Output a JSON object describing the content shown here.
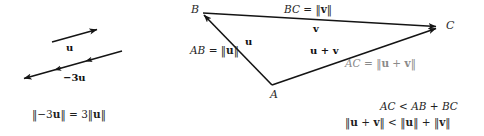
{
  "figure": {
    "background_color": "#ffffff",
    "ink_color": "#1a1a1a",
    "muted_color": "#8a8a8a"
  },
  "left_panel": {
    "name": "scalar-multiple-diagram",
    "vectors": [
      {
        "key": "u",
        "label": "u",
        "description": "short vector u pointing up and to the right",
        "x1": 52,
        "y1": 42,
        "x2": 99,
        "y2": 29,
        "tick_count": 0
      },
      {
        "key": "minus3u",
        "label": "−3u",
        "description": "vector of three times the length of u pointing down and to the left",
        "x1": 122,
        "y1": 51,
        "x2": 22,
        "y2": 79,
        "tick_count": 3
      }
    ],
    "caption": "‖−3u‖ = 3‖u‖",
    "caption_parts": {
      "lhs_open": "‖",
      "lhs_scalar": "−3",
      "lhs_vector": "u",
      "lhs_close": "‖",
      "equals": "=",
      "rhs_scalar": "3",
      "rhs_open": "‖",
      "rhs_vector": "u",
      "rhs_close": "‖"
    }
  },
  "right_panel": {
    "name": "triangle-inequality-diagram",
    "points": [
      {
        "key": "A",
        "label": "A",
        "x": 272,
        "y": 85,
        "label_x": 272,
        "label_y": 92
      },
      {
        "key": "B",
        "label": "B",
        "x": 202,
        "y": 13,
        "label_x": 192,
        "label_y": 7
      },
      {
        "key": "C",
        "label": "C",
        "x": 438,
        "y": 27,
        "label_x": 446,
        "label_y": 22
      }
    ],
    "edges": [
      {
        "key": "AB",
        "from": "A",
        "to": "B",
        "vector_label": "u",
        "length_label": "AB = ‖u‖",
        "muted": false
      },
      {
        "key": "BC",
        "from": "B",
        "to": "C",
        "vector_label": "v",
        "length_label": "BC = ‖v‖",
        "muted": false
      },
      {
        "key": "AC",
        "from": "A",
        "to": "C",
        "vector_label": "u + v",
        "length_label": "AC = ‖u + v‖",
        "muted": true
      }
    ],
    "labels": {
      "bc_segment": {
        "seg": "BC",
        "eq": "=",
        "norm_open": "‖",
        "vec": "v",
        "norm_close": "‖"
      },
      "ab_segment": {
        "seg": "AB",
        "eq": "=",
        "norm_open": "‖",
        "vec": "u",
        "norm_close": "‖"
      },
      "ac_segment": {
        "seg": "AC",
        "eq": "=",
        "norm_open": "‖",
        "vec1": "u",
        "plus": "+",
        "vec2": "v",
        "norm_close": "‖"
      },
      "vector_u": "u",
      "vector_v": "v",
      "vector_uv": {
        "vec1": "u",
        "plus": "+",
        "vec2": "v"
      }
    },
    "conclusion": {
      "line1": "AC < AB + BC",
      "line1_parts": {
        "a": "AC",
        "lt": "<",
        "b": "AB",
        "plus": "+",
        "c": "BC"
      },
      "line2": "‖u + v‖ < ‖u‖ + ‖v‖",
      "line2_parts": {
        "open1": "‖",
        "u1": "u",
        "plus1": "+",
        "v1": "v",
        "close1": "‖",
        "lt": "<",
        "open2": "‖",
        "u2": "u",
        "close2": "‖",
        "plus2": "+",
        "open3": "‖",
        "v2": "v",
        "close3": "‖"
      }
    }
  }
}
